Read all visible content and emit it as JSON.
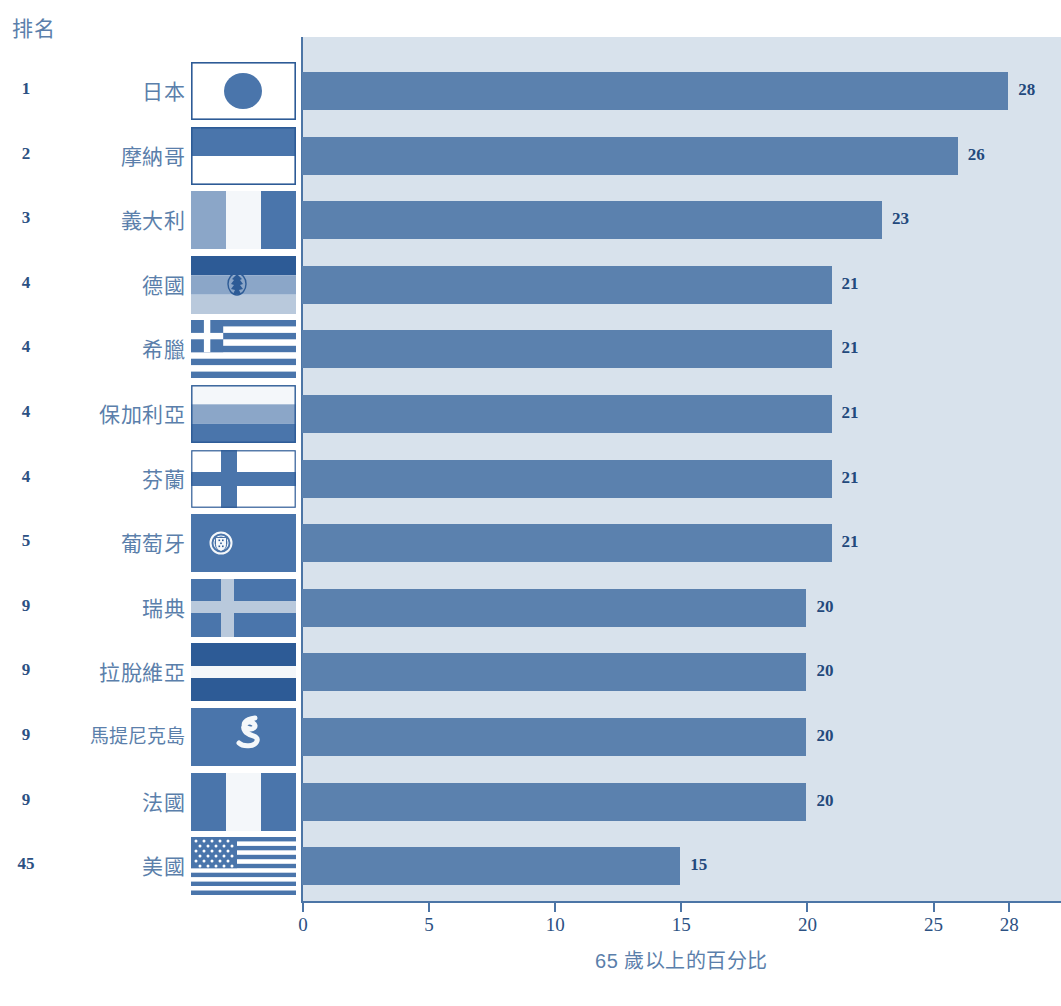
{
  "header": {
    "rank_label": "排名"
  },
  "chart_data": {
    "type": "bar",
    "orientation": "horizontal",
    "title": "",
    "xlabel": "65 歲以上的百分比",
    "ylabel": "",
    "xlim": [
      0,
      28
    ],
    "xticks": [
      0,
      5,
      10,
      15,
      20,
      25,
      28
    ],
    "xtick_labels": [
      "0",
      "5",
      "10",
      "15",
      "20",
      "25",
      "28"
    ],
    "grid": false,
    "legend": "none",
    "bar_color": "#5b81ae",
    "plot_background": "#d8e2ec",
    "axis_color": "#4c75a6",
    "value_label_color": "#23497c",
    "categories": [
      "日本",
      "摩納哥",
      "義大利",
      "德國",
      "希臘",
      "保加利亞",
      "芬蘭",
      "葡萄牙",
      "瑞典",
      "拉脫維亞",
      "馬提尼克島",
      "法國",
      "美國"
    ],
    "values": [
      28,
      26,
      23,
      21,
      21,
      21,
      21,
      21,
      20,
      20,
      20,
      20,
      15
    ],
    "ranks": [
      "1",
      "2",
      "3",
      "4",
      "4",
      "4",
      "4",
      "5",
      "9",
      "9",
      "9",
      "9",
      "45"
    ],
    "value_labels": [
      "28",
      "26",
      "23",
      "21",
      "21",
      "21",
      "21",
      "21",
      "20",
      "20",
      "20",
      "20",
      "15"
    ]
  },
  "rows": [
    {
      "rank": "1",
      "country": "日本",
      "value": 28,
      "value_label": "28",
      "flag": "flag-japan-icon"
    },
    {
      "rank": "2",
      "country": "摩納哥",
      "value": 26,
      "value_label": "26",
      "flag": "flag-monaco-icon"
    },
    {
      "rank": "3",
      "country": "義大利",
      "value": 23,
      "value_label": "23",
      "flag": "flag-italy-icon"
    },
    {
      "rank": "4",
      "country": "德國",
      "value": 21,
      "value_label": "21",
      "flag": "flag-germany-icon"
    },
    {
      "rank": "4",
      "country": "希臘",
      "value": 21,
      "value_label": "21",
      "flag": "flag-greece-icon"
    },
    {
      "rank": "4",
      "country": "保加利亞",
      "value": 21,
      "value_label": "21",
      "flag": "flag-bulgaria-icon"
    },
    {
      "rank": "4",
      "country": "芬蘭",
      "value": 21,
      "value_label": "21",
      "flag": "flag-finland-icon"
    },
    {
      "rank": "5",
      "country": "葡萄牙",
      "value": 21,
      "value_label": "21",
      "flag": "flag-portugal-icon"
    },
    {
      "rank": "9",
      "country": "瑞典",
      "value": 20,
      "value_label": "20",
      "flag": "flag-sweden-icon"
    },
    {
      "rank": "9",
      "country": "拉脫維亞",
      "value": 20,
      "value_label": "20",
      "flag": "flag-latvia-icon"
    },
    {
      "rank": "9",
      "country": "馬提尼克島",
      "value": 20,
      "value_label": "20",
      "flag": "flag-martinique-icon"
    },
    {
      "rank": "9",
      "country": "法國",
      "value": 20,
      "value_label": "20",
      "flag": "flag-france-icon"
    },
    {
      "rank": "45",
      "country": "美國",
      "value": 15,
      "value_label": "15",
      "flag": "flag-usa-icon"
    }
  ]
}
